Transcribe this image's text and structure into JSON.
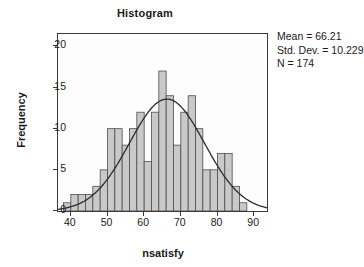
{
  "chart_data": {
    "type": "bar",
    "title": "Histogram",
    "xlabel": "nsatisfy",
    "ylabel": "Frequency",
    "xlim": [
      36.5,
      93.5
    ],
    "ylim": [
      0,
      21.5
    ],
    "grid": false,
    "legend": "none",
    "bin_width": 2,
    "xticks": [
      40,
      50,
      60,
      70,
      80,
      90
    ],
    "yticks": [
      0,
      5,
      10,
      15,
      20
    ],
    "categories": [
      39,
      41,
      43,
      45,
      47,
      49,
      51,
      53,
      55,
      57,
      59,
      61,
      63,
      65,
      67,
      69,
      71,
      73,
      75,
      77,
      79,
      81,
      83,
      85,
      87,
      89,
      91
    ],
    "values": [
      1,
      2,
      2,
      2,
      3,
      5,
      10,
      10,
      8,
      10,
      12,
      6,
      12,
      17,
      14,
      8,
      12,
      14,
      10,
      5,
      5,
      7,
      7,
      3,
      1,
      0,
      0
    ],
    "overlay_curve": {
      "name": "Normal",
      "mean": 66.21,
      "std_dev": 10.229,
      "n": 174,
      "peak_value": 13.6
    },
    "annotations": {
      "mean_label": "Mean = 66.21",
      "std_dev_label": "Std. Dev. = 10.229",
      "n_label": "N = 174"
    }
  },
  "colors": {
    "bar_fill": "#c9c9c9",
    "bar_stroke": "#4d4d4d",
    "curve": "#2b2b2b",
    "axis": "#3a3a3a",
    "text": "#1a1a1a",
    "plot_background": "#fdfdfd",
    "page_background": "#ffffff"
  }
}
